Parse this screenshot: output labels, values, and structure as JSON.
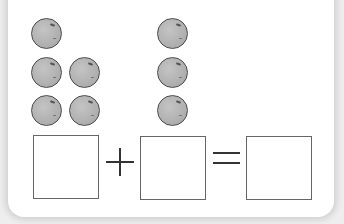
{
  "worksheet": {
    "groups": [
      {
        "name": "left-group",
        "count": 5,
        "layout": "1 on top, then 2 rows of 2"
      },
      {
        "name": "right-group",
        "count": 3,
        "layout": "single column of 3"
      }
    ],
    "equation": {
      "boxes": [
        "",
        "",
        ""
      ],
      "operator_plus": "+",
      "operator_equals": "="
    },
    "colors": {
      "ball_fill": "#b5b5b5",
      "ball_outline": "#4a4a4a",
      "box_border": "#666666",
      "panel_bg": "#ffffff",
      "page_bg": "#eeeeee"
    }
  }
}
